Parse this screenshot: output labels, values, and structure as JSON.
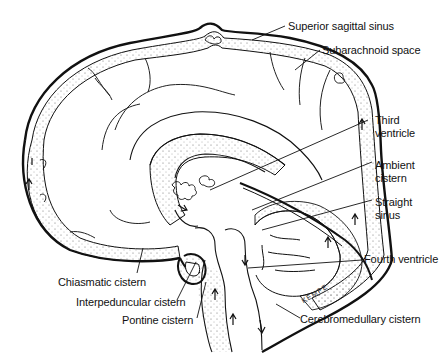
{
  "figure": {
    "artist_signature": "KEMPE",
    "colors": {
      "ink": "#111111",
      "background": "#ffffff",
      "stipple": "#555555"
    }
  },
  "labels": [
    {
      "id": "superior-sagittal-sinus",
      "text": "Superior sagittal sinus"
    },
    {
      "id": "subarachnoid-space",
      "text": "Subarachnoid space"
    },
    {
      "id": "third-ventricle-1",
      "text": "Third"
    },
    {
      "id": "third-ventricle-2",
      "text": "ventricle"
    },
    {
      "id": "ambient-cistern-1",
      "text": "Ambient"
    },
    {
      "id": "ambient-cistern-2",
      "text": "cistern"
    },
    {
      "id": "straight-sinus-1",
      "text": "Straight"
    },
    {
      "id": "straight-sinus-2",
      "text": "sinus"
    },
    {
      "id": "fourth-ventricle",
      "text": "Fourth ventricle"
    },
    {
      "id": "chiasmatic-cistern",
      "text": "Chiasmatic cistern"
    },
    {
      "id": "interpeduncular-cistern",
      "text": "Interpeduncular cistern"
    },
    {
      "id": "pontine-cistern",
      "text": "Pontine cistern"
    },
    {
      "id": "cerebromedullary-cistern",
      "text": "Cerebromedullary cistern"
    }
  ]
}
